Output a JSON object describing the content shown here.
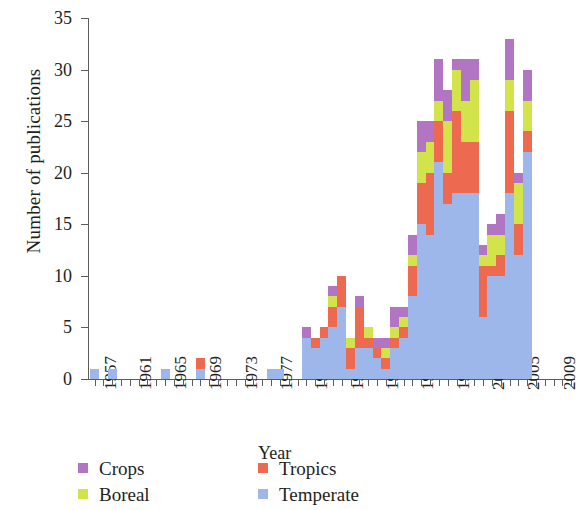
{
  "chart_data": {
    "type": "bar",
    "stacked": true,
    "title": "",
    "xlabel": "Year",
    "ylabel": "Number of publications",
    "ylim": [
      0,
      35
    ],
    "yticks": [
      0,
      5,
      10,
      15,
      20,
      25,
      30,
      35
    ],
    "grid": false,
    "legend_position": "below-axis",
    "x": [
      1957,
      1958,
      1959,
      1960,
      1961,
      1962,
      1963,
      1964,
      1965,
      1966,
      1967,
      1968,
      1969,
      1970,
      1971,
      1972,
      1973,
      1974,
      1975,
      1976,
      1977,
      1978,
      1979,
      1980,
      1981,
      1982,
      1983,
      1984,
      1985,
      1986,
      1987,
      1988,
      1989,
      1990,
      1991,
      1992,
      1993,
      1994,
      1995,
      1996,
      1997,
      1998,
      1999,
      2000,
      2001,
      2002,
      2003,
      2004,
      2005,
      2006,
      2007,
      2008,
      2009,
      2010,
      2011
    ],
    "xtick_labels": [
      "1957",
      "1961",
      "1965",
      "1969",
      "1973",
      "1977",
      "1981",
      "1985",
      "1989",
      "1993",
      "1997",
      "2001",
      "2005",
      "2009"
    ],
    "xtick_step": 4,
    "series": [
      {
        "name": "Temperate",
        "color": "#9db7ea",
        "values": [
          1,
          0,
          1,
          0,
          0,
          0,
          0,
          0,
          1,
          0,
          0,
          0,
          1,
          0,
          0,
          0,
          0,
          0,
          0,
          0,
          1,
          1,
          0,
          0,
          4,
          3,
          4,
          5,
          7,
          1,
          3,
          3,
          2,
          1,
          3,
          4,
          8,
          15,
          14,
          21,
          17,
          18,
          18,
          18,
          6,
          10,
          10,
          18,
          12,
          22,
          0,
          0,
          0,
          0,
          0
        ]
      },
      {
        "name": "Tropics",
        "color": "#ed6a50",
        "values": [
          0,
          0,
          0,
          0,
          0,
          0,
          0,
          0,
          0,
          0,
          0,
          0,
          1,
          0,
          0,
          0,
          0,
          0,
          0,
          0,
          0,
          0,
          0,
          0,
          0,
          1,
          1,
          2,
          3,
          2,
          4,
          1,
          1,
          1,
          1,
          1,
          3,
          4,
          6,
          4,
          3,
          8,
          5,
          5,
          5,
          1,
          2,
          8,
          3,
          2,
          0,
          0,
          0,
          0,
          0
        ]
      },
      {
        "name": "Boreal",
        "color": "#d3e34b",
        "values": [
          0,
          0,
          0,
          0,
          0,
          0,
          0,
          0,
          0,
          0,
          0,
          0,
          0,
          0,
          0,
          0,
          0,
          0,
          0,
          0,
          0,
          0,
          0,
          0,
          0,
          0,
          0,
          1,
          0,
          1,
          0,
          1,
          0,
          1,
          1,
          1,
          1,
          3,
          3,
          2,
          5,
          4,
          4,
          6,
          1,
          3,
          2,
          3,
          4,
          3,
          0,
          0,
          0,
          0,
          0
        ]
      },
      {
        "name": "Crops",
        "color": "#b175c4",
        "values": [
          0,
          0,
          0,
          0,
          0,
          0,
          0,
          0,
          0,
          0,
          0,
          0,
          0,
          0,
          0,
          0,
          0,
          0,
          0,
          0,
          0,
          0,
          0,
          0,
          1,
          0,
          0,
          1,
          0,
          0,
          1,
          0,
          1,
          1,
          2,
          1,
          2,
          3,
          2,
          4,
          3,
          1,
          4,
          2,
          1,
          1,
          2,
          4,
          1,
          3,
          0,
          0,
          0,
          0,
          0
        ]
      }
    ],
    "totals": [
      1,
      0,
      1,
      0,
      0,
      0,
      0,
      0,
      1,
      0,
      0,
      0,
      2,
      0,
      0,
      0,
      0,
      0,
      0,
      0,
      1,
      1,
      0,
      0,
      5,
      4,
      5,
      9,
      10,
      4,
      8,
      5,
      4,
      4,
      7,
      7,
      14,
      25,
      25,
      31,
      28,
      31,
      31,
      31,
      13,
      15,
      16,
      33,
      20,
      30,
      0,
      0,
      0,
      0,
      0
    ]
  },
  "axis": {
    "y_title": "Number of publications",
    "x_title": "Year",
    "y_ticks": [
      "0",
      "5",
      "10",
      "15",
      "20",
      "25",
      "30",
      "35"
    ],
    "x_ticks": [
      "1957",
      "1961",
      "1965",
      "1969",
      "1973",
      "1977",
      "1981",
      "1985",
      "1989",
      "1993",
      "1997",
      "2001",
      "2005",
      "2009"
    ]
  },
  "legend": {
    "entries": [
      {
        "label": "Crops",
        "color": "#b175c4",
        "swatch_name": "crops-swatch"
      },
      {
        "label": "Tropics",
        "color": "#ed6a50",
        "swatch_name": "tropics-swatch"
      },
      {
        "label": "Boreal",
        "color": "#d3e34b",
        "swatch_name": "boreal-swatch"
      },
      {
        "label": "Temperate",
        "color": "#9db7ea",
        "swatch_name": "temperate-swatch"
      }
    ]
  }
}
